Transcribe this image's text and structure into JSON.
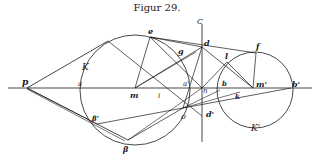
{
  "title": "Figur 29.",
  "labels": {
    "p": "p",
    "a": "a",
    "K": "K",
    "m": "m",
    "i": "i",
    "e": "e",
    "g": "g",
    "C": "C",
    "d": "d",
    "a_prime": "a'",
    "n": "n",
    "o": "o",
    "d_prime": "d'",
    "l": "l",
    "b": "b",
    "m_prime": "m'",
    "f": "f",
    "b_prime": "b'",
    "k": "k",
    "K_prime": "K'",
    "beta": "β",
    "beta_prime": "β'"
  },
  "colors": {
    "ink": "#1a1a1a",
    "paper": "#ffffff"
  }
}
